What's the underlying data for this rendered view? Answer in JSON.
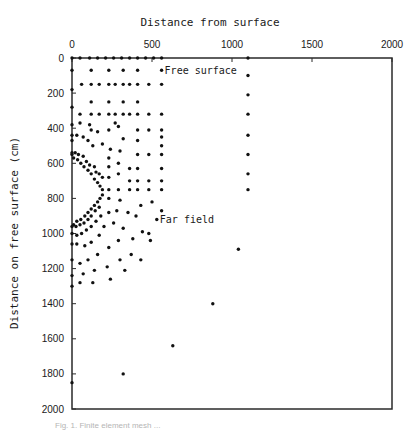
{
  "chart_data": {
    "type": "scatter",
    "title": "Distance from surface",
    "xlabel": "Distance from surface",
    "ylabel": "Distance on free surface (cm)",
    "xlim": [
      0,
      2000
    ],
    "ylim": [
      0,
      2000
    ],
    "y_inverted": true,
    "x_axis_position": "top",
    "grid": false,
    "x_ticks": [
      0,
      500,
      1000,
      1500,
      2000
    ],
    "y_ticks": [
      0,
      200,
      400,
      600,
      800,
      1000,
      1200,
      1400,
      1600,
      1800,
      2000
    ],
    "annotations": [
      {
        "text": "Free surface",
        "x": 560,
        "y": 70
      },
      {
        "text": "Far field",
        "x": 530,
        "y": 920
      }
    ],
    "points": [
      [
        0,
        0
      ],
      [
        50,
        0
      ],
      [
        110,
        0
      ],
      [
        160,
        0
      ],
      [
        210,
        0
      ],
      [
        260,
        0
      ],
      [
        310,
        0
      ],
      [
        360,
        0
      ],
      [
        410,
        0
      ],
      [
        460,
        0
      ],
      [
        510,
        0
      ],
      [
        560,
        0
      ],
      [
        1100,
        0
      ],
      [
        0,
        70
      ],
      [
        0,
        180
      ],
      [
        0,
        280
      ],
      [
        0,
        380
      ],
      [
        0,
        470
      ],
      [
        0,
        550
      ],
      [
        120,
        70
      ],
      [
        230,
        70
      ],
      [
        320,
        70
      ],
      [
        410,
        70
      ],
      [
        560,
        70
      ],
      [
        1100,
        100
      ],
      [
        60,
        150
      ],
      [
        120,
        150
      ],
      [
        170,
        150
      ],
      [
        230,
        150
      ],
      [
        270,
        150
      ],
      [
        320,
        150
      ],
      [
        360,
        150
      ],
      [
        410,
        150
      ],
      [
        480,
        150
      ],
      [
        560,
        150
      ],
      [
        120,
        250
      ],
      [
        230,
        250
      ],
      [
        320,
        250
      ],
      [
        410,
        250
      ],
      [
        1100,
        210
      ],
      [
        50,
        320
      ],
      [
        120,
        320
      ],
      [
        170,
        320
      ],
      [
        230,
        320
      ],
      [
        270,
        320
      ],
      [
        320,
        320
      ],
      [
        360,
        320
      ],
      [
        410,
        320
      ],
      [
        480,
        320
      ],
      [
        560,
        320
      ],
      [
        1100,
        320
      ],
      [
        120,
        410
      ],
      [
        230,
        410
      ],
      [
        290,
        390
      ],
      [
        320,
        460
      ],
      [
        410,
        410
      ],
      [
        480,
        410
      ],
      [
        560,
        410
      ],
      [
        50,
        370
      ],
      [
        110,
        380
      ],
      [
        160,
        420
      ],
      [
        270,
        370
      ],
      [
        560,
        450
      ],
      [
        1100,
        440
      ],
      [
        0,
        440
      ],
      [
        30,
        440
      ],
      [
        70,
        450
      ],
      [
        100,
        470
      ],
      [
        130,
        500
      ],
      [
        190,
        490
      ],
      [
        240,
        520
      ],
      [
        300,
        530
      ],
      [
        410,
        470
      ],
      [
        560,
        500
      ],
      [
        0,
        540
      ],
      [
        20,
        540
      ],
      [
        40,
        550
      ],
      [
        70,
        560
      ],
      [
        90,
        590
      ],
      [
        110,
        610
      ],
      [
        140,
        620
      ],
      [
        150,
        650
      ],
      [
        170,
        660
      ],
      [
        190,
        680
      ],
      [
        10,
        570
      ],
      [
        35,
        580
      ],
      [
        55,
        600
      ],
      [
        75,
        620
      ],
      [
        100,
        640
      ],
      [
        120,
        660
      ],
      [
        140,
        690
      ],
      [
        160,
        710
      ],
      [
        175,
        730
      ],
      [
        190,
        750
      ],
      [
        230,
        570
      ],
      [
        230,
        620
      ],
      [
        230,
        680
      ],
      [
        230,
        750
      ],
      [
        290,
        600
      ],
      [
        290,
        660
      ],
      [
        290,
        750
      ],
      [
        360,
        630
      ],
      [
        360,
        700
      ],
      [
        360,
        750
      ],
      [
        410,
        550
      ],
      [
        410,
        630
      ],
      [
        410,
        700
      ],
      [
        410,
        750
      ],
      [
        480,
        550
      ],
      [
        480,
        700
      ],
      [
        480,
        750
      ],
      [
        560,
        550
      ],
      [
        560,
        630
      ],
      [
        560,
        700
      ],
      [
        560,
        750
      ],
      [
        1100,
        550
      ],
      [
        1100,
        660
      ],
      [
        1100,
        750
      ],
      [
        190,
        780
      ],
      [
        175,
        800
      ],
      [
        160,
        820
      ],
      [
        140,
        840
      ],
      [
        120,
        860
      ],
      [
        100,
        880
      ],
      [
        80,
        900
      ],
      [
        55,
        920
      ],
      [
        30,
        930
      ],
      [
        10,
        950
      ],
      [
        170,
        850
      ],
      [
        145,
        870
      ],
      [
        120,
        900
      ],
      [
        100,
        920
      ],
      [
        75,
        940
      ],
      [
        50,
        950
      ],
      [
        25,
        960
      ],
      [
        0,
        960
      ],
      [
        230,
        800
      ],
      [
        300,
        810
      ],
      [
        280,
        870
      ],
      [
        230,
        880
      ],
      [
        180,
        900
      ],
      [
        150,
        930
      ],
      [
        120,
        960
      ],
      [
        90,
        980
      ],
      [
        60,
        1000
      ],
      [
        30,
        1010
      ],
      [
        0,
        1000
      ],
      [
        350,
        880
      ],
      [
        400,
        900
      ],
      [
        430,
        840
      ],
      [
        500,
        820
      ],
      [
        530,
        920
      ],
      [
        560,
        870
      ],
      [
        260,
        940
      ],
      [
        200,
        960
      ],
      [
        170,
        1010
      ],
      [
        120,
        1050
      ],
      [
        80,
        1070
      ],
      [
        30,
        1060
      ],
      [
        0,
        1060
      ],
      [
        320,
        970
      ],
      [
        440,
        990
      ],
      [
        480,
        1000
      ],
      [
        380,
        1030
      ],
      [
        290,
        1040
      ],
      [
        230,
        1080
      ],
      [
        160,
        1120
      ],
      [
        100,
        1150
      ],
      [
        50,
        1170
      ],
      [
        0,
        1150
      ],
      [
        370,
        1120
      ],
      [
        300,
        1150
      ],
      [
        220,
        1190
      ],
      [
        140,
        1210
      ],
      [
        70,
        1230
      ],
      [
        0,
        1240
      ],
      [
        490,
        1040
      ],
      [
        430,
        1150
      ],
      [
        330,
        1210
      ],
      [
        240,
        1260
      ],
      [
        130,
        1280
      ],
      [
        50,
        1280
      ],
      [
        0,
        1300
      ],
      [
        1040,
        1090
      ],
      [
        880,
        1400
      ],
      [
        630,
        1640
      ],
      [
        320,
        1800
      ],
      [
        0,
        1850
      ]
    ]
  },
  "figure": {
    "caption": "Fig. 1.  Finite element mesh ..."
  }
}
